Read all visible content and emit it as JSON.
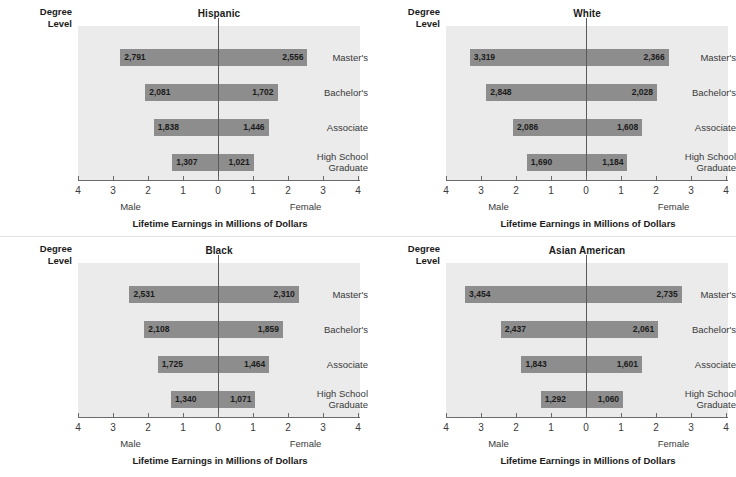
{
  "axis_header": "Degree Level",
  "axis_header_line1": "Degree",
  "axis_header_line2": "Level",
  "x_axis_title": "Lifetime Earnings in Millions of Dollars",
  "male_label": "Male",
  "female_label": "Female",
  "tick_labels_left": [
    "4",
    "3",
    "2",
    "1",
    "0"
  ],
  "tick_labels_right": [
    "1",
    "2",
    "3",
    "4"
  ],
  "all_tick_labels": [
    "4",
    "3",
    "2",
    "1",
    "0",
    "1",
    "2",
    "3",
    "4"
  ],
  "degree_levels": [
    "Master's",
    "Bachelor's",
    "Associate",
    "High School Graduate"
  ],
  "degree_levels_display": [
    {
      "line1": "Master's",
      "line2": ""
    },
    {
      "line1": "Bachelor's",
      "line2": ""
    },
    {
      "line1": "Associate",
      "line2": ""
    },
    {
      "line1": "High School",
      "line2": "Graduate"
    }
  ],
  "colors": {
    "bar": "#8d8d8d",
    "plot_background": "#ebebeb",
    "axis": "#6a6a6a",
    "zero_line": "#5a5a5a",
    "text": "#1b1b1b"
  },
  "panels": [
    {
      "title": "Hispanic",
      "rows": [
        {
          "level": "Master's",
          "male": 2791,
          "female": 2556,
          "male_label": "2,791",
          "female_label": "2,556"
        },
        {
          "level": "Bachelor's",
          "male": 2081,
          "female": 1702,
          "male_label": "2,081",
          "female_label": "1,702"
        },
        {
          "level": "Associate",
          "male": 1838,
          "female": 1446,
          "male_label": "1,838",
          "female_label": "1,446"
        },
        {
          "level": "High School Graduate",
          "male": 1307,
          "female": 1021,
          "male_label": "1,307",
          "female_label": "1,021"
        }
      ]
    },
    {
      "title": "White",
      "rows": [
        {
          "level": "Master's",
          "male": 3319,
          "female": 2366,
          "male_label": "3,319",
          "female_label": "2,366"
        },
        {
          "level": "Bachelor's",
          "male": 2848,
          "female": 2028,
          "male_label": "2,848",
          "female_label": "2,028"
        },
        {
          "level": "Associate",
          "male": 2086,
          "female": 1608,
          "male_label": "2,086",
          "female_label": "1,608"
        },
        {
          "level": "High School Graduate",
          "male": 1690,
          "female": 1184,
          "male_label": "1,690",
          "female_label": "1,184"
        }
      ]
    },
    {
      "title": "Black",
      "rows": [
        {
          "level": "Master's",
          "male": 2531,
          "female": 2310,
          "male_label": "2,531",
          "female_label": "2,310"
        },
        {
          "level": "Bachelor's",
          "male": 2108,
          "female": 1859,
          "male_label": "2,108",
          "female_label": "1,859"
        },
        {
          "level": "Associate",
          "male": 1725,
          "female": 1464,
          "male_label": "1,725",
          "female_label": "1,464"
        },
        {
          "level": "High School Graduate",
          "male": 1340,
          "female": 1071,
          "male_label": "1,340",
          "female_label": "1,071"
        }
      ]
    },
    {
      "title": "Asian American",
      "rows": [
        {
          "level": "Master's",
          "male": 3454,
          "female": 2735,
          "male_label": "3,454",
          "female_label": "2,735"
        },
        {
          "level": "Bachelor's",
          "male": 2437,
          "female": 2061,
          "male_label": "2,437",
          "female_label": "2,061"
        },
        {
          "level": "Associate",
          "male": 1843,
          "female": 1601,
          "male_label": "1,843",
          "female_label": "1,601"
        },
        {
          "level": "High School Graduate",
          "male": 1292,
          "female": 1060,
          "male_label": "1,292",
          "female_label": "1,060"
        }
      ]
    }
  ],
  "chart_data": {
    "type": "bar",
    "subtype": "diverging-horizontal-bar-small-multiples",
    "title": "",
    "xlabel": "Lifetime Earnings in Millions of Dollars",
    "ylabel": "Degree Level",
    "xlim": [
      -4,
      4
    ],
    "xticks": [
      -4,
      -3,
      -2,
      -1,
      0,
      1,
      2,
      3,
      4
    ],
    "xticklabels": [
      "4",
      "3",
      "2",
      "1",
      "0",
      "1",
      "2",
      "3",
      "4"
    ],
    "units": "millions of dollars",
    "grid": false,
    "legend": "none",
    "direction_labels": {
      "left": "Male",
      "right": "Female"
    },
    "categories": [
      "Master's",
      "Bachelor's",
      "Associate",
      "High School Graduate"
    ],
    "panels": [
      {
        "name": "Hispanic",
        "series": [
          {
            "name": "Male",
            "values": [
              2.791,
              2.081,
              1.838,
              1.307
            ],
            "direction": "left"
          },
          {
            "name": "Female",
            "values": [
              2.556,
              1.702,
              1.446,
              1.021
            ],
            "direction": "right"
          }
        ]
      },
      {
        "name": "White",
        "series": [
          {
            "name": "Male",
            "values": [
              3.319,
              2.848,
              2.086,
              1.69
            ],
            "direction": "left"
          },
          {
            "name": "Female",
            "values": [
              2.366,
              2.028,
              1.608,
              1.184
            ],
            "direction": "right"
          }
        ]
      },
      {
        "name": "Black",
        "series": [
          {
            "name": "Male",
            "values": [
              2.531,
              2.108,
              1.725,
              1.34
            ],
            "direction": "left"
          },
          {
            "name": "Female",
            "values": [
              2.31,
              1.859,
              1.464,
              1.071
            ],
            "direction": "right"
          }
        ]
      },
      {
        "name": "Asian American",
        "series": [
          {
            "name": "Male",
            "values": [
              3.454,
              2.437,
              1.843,
              1.292
            ],
            "direction": "left"
          },
          {
            "name": "Female",
            "values": [
              2.735,
              2.061,
              1.601,
              1.06
            ],
            "direction": "right"
          }
        ]
      }
    ]
  }
}
